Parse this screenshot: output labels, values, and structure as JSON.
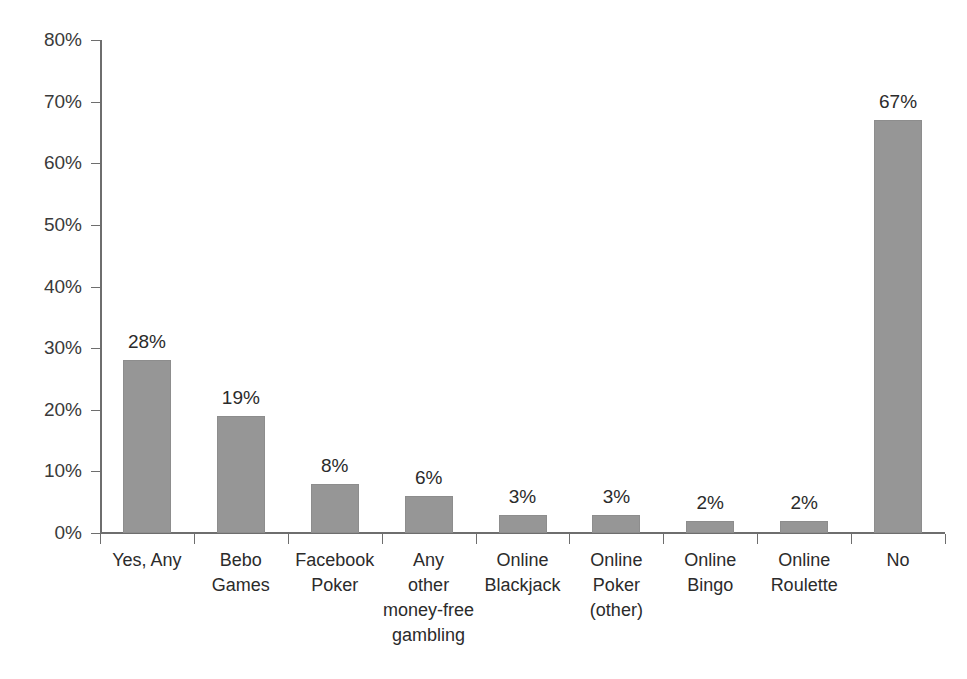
{
  "chart_data": {
    "type": "bar",
    "title": "",
    "subtitle": "",
    "xlabel": "",
    "ylabel": "",
    "ylim": [
      0,
      80
    ],
    "ytick_values": [
      80,
      70,
      60,
      50,
      40,
      30,
      20,
      10,
      0
    ],
    "ytick_labels": [
      "80%",
      "70%",
      "60%",
      "50%",
      "40%",
      "30%",
      "20%",
      "10%",
      "0%"
    ],
    "grid": false,
    "legend": false,
    "legend_position": "none",
    "categories": [
      "Yes, Any",
      "Bebo\nGames",
      "Facebook\nPoker",
      "Any\nother\nmoney-free\ngambling",
      "Online\nBlackjack",
      "Online\nPoker\n(other)",
      "Online\nBingo",
      "Online\nRoulette",
      "No"
    ],
    "values": [
      28,
      19,
      8,
      6,
      3,
      3,
      2,
      2,
      67
    ],
    "data_labels": [
      "28%",
      "19%",
      "8%",
      "6%",
      "3%",
      "3%",
      "2%",
      "2%",
      "67%"
    ],
    "bar_color": "#969696",
    "axis_color": "#6e6e6e",
    "text_color": "#2b2b2b",
    "background_color": "#ffffff"
  }
}
